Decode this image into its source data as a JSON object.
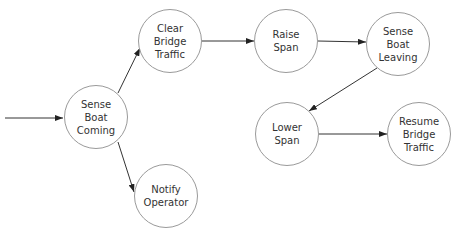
{
  "diagram": {
    "type": "flowchart",
    "nodes": [
      {
        "id": "sense_boat_coming",
        "label": "Sense\nBoat\nComing",
        "cx": 96,
        "cy": 117
      },
      {
        "id": "clear_bridge_traffic",
        "label": "Clear\nBridge\nTraffic",
        "cx": 170,
        "cy": 41
      },
      {
        "id": "raise_span",
        "label": "Raise\nSpan",
        "cx": 286,
        "cy": 41
      },
      {
        "id": "sense_boat_leaving",
        "label": "Sense\nBoat\nLeaving",
        "cx": 398,
        "cy": 44
      },
      {
        "id": "lower_span",
        "label": "Lower\nSpan",
        "cx": 287,
        "cy": 134
      },
      {
        "id": "resume_bridge_traffic",
        "label": "Resume\nBridge\nTraffic",
        "cx": 419,
        "cy": 134
      },
      {
        "id": "notify_operator",
        "label": "Notify\nOperator",
        "cx": 166,
        "cy": 196
      }
    ],
    "edges": [
      {
        "from": "input",
        "to": "sense_boat_coming"
      },
      {
        "from": "sense_boat_coming",
        "to": "clear_bridge_traffic"
      },
      {
        "from": "sense_boat_coming",
        "to": "notify_operator"
      },
      {
        "from": "clear_bridge_traffic",
        "to": "raise_span"
      },
      {
        "from": "raise_span",
        "to": "sense_boat_leaving"
      },
      {
        "from": "sense_boat_leaving",
        "to": "lower_span"
      },
      {
        "from": "lower_span",
        "to": "resume_bridge_traffic"
      }
    ],
    "colors": {
      "node_border": "#9a9a9a",
      "edge": "#333333",
      "text": "#333333"
    }
  }
}
